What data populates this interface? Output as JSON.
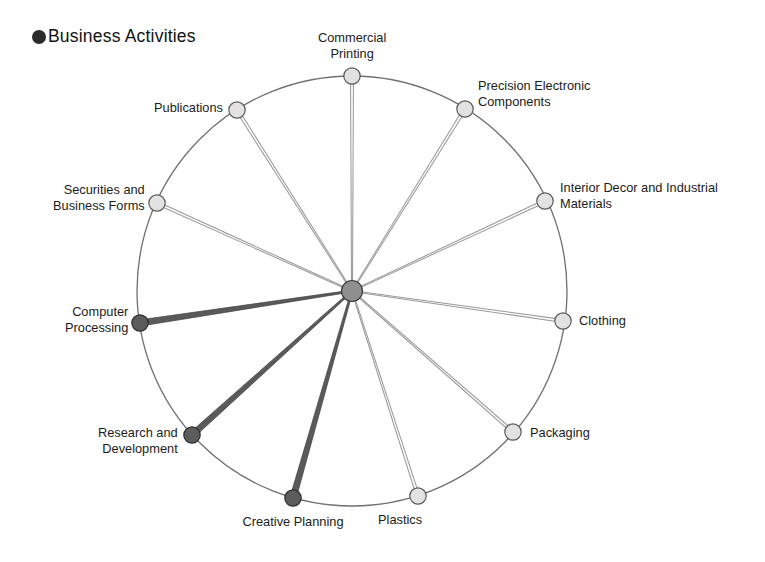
{
  "figure": {
    "type": "radial-hub-and-spoke-diagram",
    "center": {
      "x": 352,
      "y": 291,
      "radius": 10.5
    },
    "ring": {
      "cx": 352,
      "cy": 291,
      "r": 215
    },
    "colors": {
      "highlight_node": "#5c5c5c",
      "highlight_node_stroke": "#2f2f2f",
      "normal_node": "#e2e2e2",
      "normal_node_stroke": "#5a5a5a",
      "highlight_spoke": "#5a5a5a",
      "normal_spoke": "#9a9a9a",
      "ring_stroke": "#6f6f6f",
      "hub_fill": "#8f8f8f",
      "text": "#1b1b1b",
      "background": "#ffffff"
    }
  },
  "legend": {
    "marker": "filled-circle",
    "label": "Business Activities"
  },
  "nodes": [
    {
      "id": "commercial-printing",
      "label": "Commercial\nPrinting",
      "highlighted": false,
      "angle_deg": -90,
      "node": {
        "x": 352,
        "y": 76
      },
      "label_pos": {
        "x": 352,
        "y": 30
      },
      "label_align": "center"
    },
    {
      "id": "precision-electronic-components",
      "label": "Precision Electronic\nComponents",
      "highlighted": false,
      "angle_deg": -57,
      "node": {
        "x": 465,
        "y": 109
      },
      "label_pos": {
        "x": 478,
        "y": 78
      },
      "label_align": "left"
    },
    {
      "id": "interior-decor-and-industrial-materials",
      "label": "Interior Decor and Industrial\nMaterials",
      "highlighted": false,
      "angle_deg": -24,
      "node": {
        "x": 545,
        "y": 201
      },
      "label_pos": {
        "x": 560,
        "y": 180
      },
      "label_align": "left"
    },
    {
      "id": "clothing",
      "label": "Clothing",
      "highlighted": false,
      "angle_deg": 8,
      "node": {
        "x": 563,
        "y": 321
      },
      "label_pos": {
        "x": 579,
        "y": 313
      },
      "label_align": "left"
    },
    {
      "id": "packaging",
      "label": "Packaging",
      "highlighted": false,
      "angle_deg": 41,
      "node": {
        "x": 513,
        "y": 432
      },
      "label_pos": {
        "x": 530,
        "y": 425
      },
      "label_align": "left"
    },
    {
      "id": "plastics",
      "label": "Plastics",
      "highlighted": false,
      "angle_deg": 72,
      "node": {
        "x": 418,
        "y": 496
      },
      "label_pos": {
        "x": 400,
        "y": 512
      },
      "label_align": "center"
    },
    {
      "id": "creative-planning",
      "label": "Creative Planning",
      "highlighted": true,
      "angle_deg": 105,
      "node": {
        "x": 293,
        "y": 498
      },
      "label_pos": {
        "x": 293,
        "y": 514
      },
      "label_align": "center"
    },
    {
      "id": "research-and-development",
      "label": "Research and\nDevelopment",
      "highlighted": true,
      "angle_deg": 137,
      "node": {
        "x": 192,
        "y": 435
      },
      "label_pos": {
        "x": 178,
        "y": 425
      },
      "label_align": "right"
    },
    {
      "id": "computer-processing",
      "label": "Computer\nProcessing",
      "highlighted": true,
      "angle_deg": 171,
      "node": {
        "x": 140,
        "y": 323
      },
      "label_pos": {
        "x": 128,
        "y": 304
      },
      "label_align": "right"
    },
    {
      "id": "securities-and-business-forms",
      "label": "Securities and\nBusiness Forms",
      "highlighted": false,
      "angle_deg": 203,
      "node": {
        "x": 157,
        "y": 203
      },
      "label_pos": {
        "x": 145,
        "y": 182
      },
      "label_align": "right"
    },
    {
      "id": "publications",
      "label": "Publications",
      "highlighted": false,
      "angle_deg": 237,
      "node": {
        "x": 237,
        "y": 110
      },
      "label_pos": {
        "x": 223,
        "y": 100
      },
      "label_align": "right"
    }
  ]
}
